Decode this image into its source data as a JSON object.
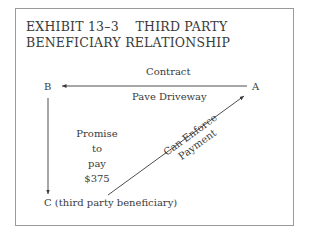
{
  "exhibit": {
    "title_line1": "EXHIBIT 13–3    THIRD PARTY",
    "title_line2": "BENEFICIARY RELATIONSHIP"
  },
  "nodes": {
    "a": "A",
    "b": "B",
    "c": "C (third party beneficiary)"
  },
  "edges": {
    "a_to_b_top": "Contract",
    "a_to_b_bottom": "Pave Driveway",
    "b_to_c": [
      "Promise",
      "to",
      "pay",
      "$375"
    ],
    "c_to_a": [
      "Can Enforce",
      "Payment"
    ]
  },
  "colors": {
    "ink": "#3a3a3a",
    "border": "#9a9a9a"
  }
}
